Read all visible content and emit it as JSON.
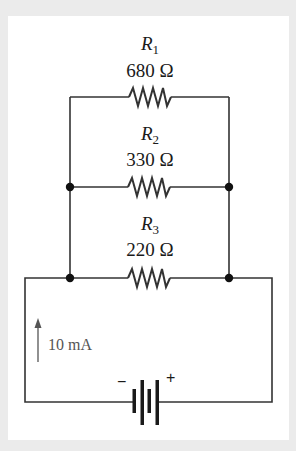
{
  "diagram": {
    "type": "circuit-schematic",
    "title": "",
    "resistors": [
      {
        "name": "R",
        "subscript": "1",
        "value": "680 Ω"
      },
      {
        "name": "R",
        "subscript": "2",
        "value": "330 Ω"
      },
      {
        "name": "R",
        "subscript": "3",
        "value": "220 Ω"
      }
    ],
    "source": {
      "type": "battery",
      "negative_label": "−",
      "positive_label": "+"
    },
    "current_label": "10 mA",
    "colors": {
      "wire": "#333333",
      "background": "#ebebeb",
      "panel": "#ffffff",
      "current_text": "#555555"
    }
  }
}
